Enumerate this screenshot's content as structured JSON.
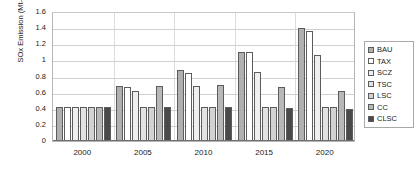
{
  "chart_data": {
    "type": "bar",
    "title": "",
    "xlabel": "",
    "ylabel": "SOx Emission (Mt-S/yr.)",
    "categories": [
      "2000",
      "2005",
      "2010",
      "2015",
      "2020"
    ],
    "ylim": [
      0,
      1.6
    ],
    "yticks": [
      "0",
      "0.2",
      "0.4",
      "0.6",
      "0.8",
      "1",
      "1.2",
      "1.4",
      "1.6"
    ],
    "ytick_values": [
      0,
      0.2,
      0.4,
      0.6,
      0.8,
      1,
      1.2,
      1.4,
      1.6
    ],
    "grid": true,
    "legend_position": "right",
    "series": [
      {
        "name": "BAU",
        "color": "#b0b0b0",
        "values": [
          0.42,
          0.68,
          0.88,
          1.11,
          1.4
        ]
      },
      {
        "name": "TAX",
        "color": "#ffffff",
        "values": [
          0.42,
          0.675,
          0.845,
          1.1,
          1.36
        ]
      },
      {
        "name": "SCZ",
        "color": "#efefef",
        "values": [
          0.42,
          0.625,
          0.68,
          0.86,
          1.065
        ]
      },
      {
        "name": "TSC",
        "color": "#e2e2e2",
        "values": [
          0.42,
          0.42,
          0.42,
          0.42,
          0.42
        ]
      },
      {
        "name": "LSC",
        "color": "#d2d2d2",
        "values": [
          0.42,
          0.42,
          0.42,
          0.42,
          0.42
        ]
      },
      {
        "name": "CC",
        "color": "#b8b8b8",
        "values": [
          0.42,
          0.685,
          0.7,
          0.665,
          0.62
        ]
      },
      {
        "name": "CLSC",
        "color": "#4a4a4a",
        "values": [
          0.42,
          0.42,
          0.425,
          0.415,
          0.395
        ]
      }
    ]
  },
  "legend": {
    "items": [
      {
        "label": "BAU"
      },
      {
        "label": "TAX"
      },
      {
        "label": "SCZ"
      },
      {
        "label": "TSC"
      },
      {
        "label": "LSC"
      },
      {
        "label": "CC"
      },
      {
        "label": "CLSC"
      }
    ]
  }
}
